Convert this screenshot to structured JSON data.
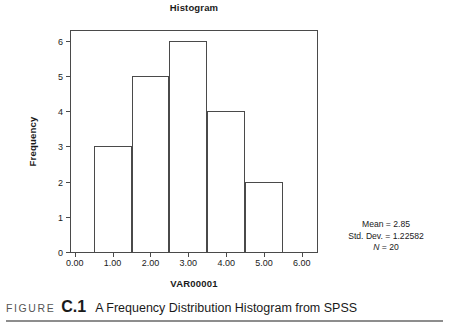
{
  "figure": {
    "caption_word": "FIGURE",
    "caption_number": "C.1",
    "caption_text": "A Frequency Distribution Histogram from SPSS"
  },
  "statistics": {
    "mean_line": "Mean = 2.85",
    "stddev_line": "Std. Dev. = 1.22582",
    "n_symbol": "N",
    "n_value": " = 20"
  },
  "chart_data": {
    "type": "bar",
    "title": "Histogram",
    "xlabel": "VAR00001",
    "ylabel": "Frequency",
    "categories": [
      "1.00",
      "2.00",
      "3.00",
      "4.00",
      "5.00"
    ],
    "values": [
      3,
      5,
      6,
      4,
      2
    ],
    "bin_edges": [
      0.5,
      1.5,
      2.5,
      3.5,
      4.5,
      5.5
    ],
    "xlim": [
      -0.1,
      6.4
    ],
    "ylim": [
      0,
      6.27
    ],
    "xticks": [
      0,
      1,
      2,
      3,
      4,
      5,
      6
    ],
    "xtick_labels": [
      "0.00",
      "1.00",
      "2.00",
      "3.00",
      "4.00",
      "5.00",
      "6.00"
    ],
    "yticks": [
      0,
      1,
      2,
      3,
      4,
      5,
      6
    ],
    "ytick_labels": [
      "0",
      "1",
      "2",
      "3",
      "4",
      "5",
      "6"
    ],
    "grid": false,
    "legend": null,
    "bar_fill": "#ffffff",
    "bar_edge": "#4a4a4a",
    "annotations": [
      "Mean = 2.85",
      "Std. Dev. = 1.22582",
      "N = 20"
    ]
  }
}
